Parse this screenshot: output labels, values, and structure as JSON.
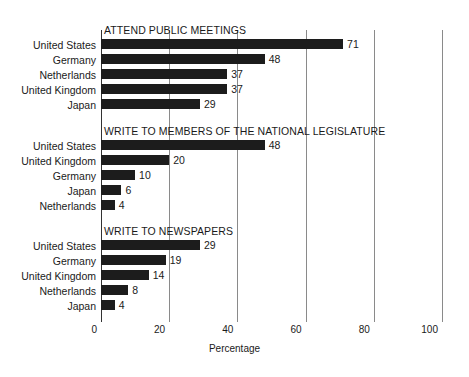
{
  "chart_data": {
    "type": "bar",
    "title": "",
    "xlabel": "Percentage",
    "ylabel": "",
    "xlim": [
      0,
      100
    ],
    "xticks": [
      0,
      20,
      40,
      60,
      80,
      100
    ],
    "xtick_labels": [
      "0",
      "20",
      "40",
      "60",
      "80",
      "100"
    ],
    "grid": "vertical",
    "legend": "none",
    "orientation": "horizontal",
    "panels": [
      {
        "title": "ATTEND PUBLIC MEETINGS",
        "categories": [
          "United States",
          "Germany",
          "Netherlands",
          "United Kingdom",
          "Japan"
        ],
        "values": [
          71,
          48,
          37,
          37,
          29
        ]
      },
      {
        "title": "WRITE TO MEMBERS OF THE NATIONAL LEGISLATURE",
        "categories": [
          "United States",
          "United Kingdom",
          "Germany",
          "Japan",
          "Netherlands"
        ],
        "values": [
          48,
          20,
          10,
          6,
          4
        ]
      },
      {
        "title": "WRITE TO NEWSPAPERS",
        "categories": [
          "United States",
          "Germany",
          "United Kingdom",
          "Netherlands",
          "Japan"
        ],
        "values": [
          29,
          19,
          14,
          8,
          4
        ]
      }
    ],
    "colors": {
      "bar": "#1c1c1c",
      "gridline": "#8a8a8a",
      "axis": "#333333",
      "text": "#1a1a1a",
      "background": "#ffffff"
    }
  }
}
